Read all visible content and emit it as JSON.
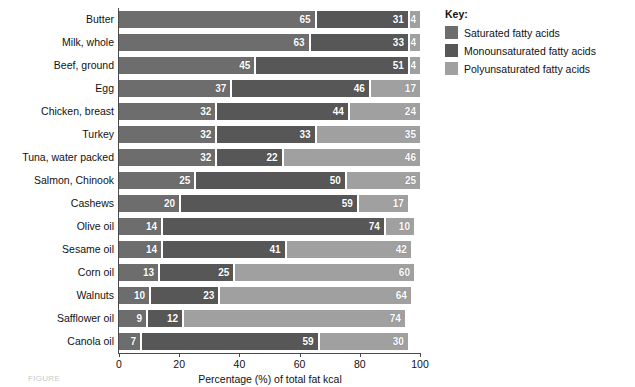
{
  "chart_data": {
    "type": "bar",
    "orientation": "horizontal",
    "stacked": true,
    "title": "",
    "xlabel": "Percentage (%) of total fat kcal",
    "ylabel": "",
    "xlim": [
      0,
      100
    ],
    "xticks": [
      "0",
      "20",
      "40",
      "60",
      "80",
      "100"
    ],
    "grid": false,
    "legend_position": "right",
    "categories": [
      "Butter",
      "Milk, whole",
      "Beef, ground",
      "Egg",
      "Chicken, breast",
      "Turkey",
      "Tuna, water packed",
      "Salmon, Chinook",
      "Cashews",
      "Olive oil",
      "Sesame oil",
      "Corn oil",
      "Walnuts",
      "Safflower oil",
      "Canola oil"
    ],
    "series": [
      {
        "name": "Saturated fatty acids",
        "color": "#6d6d6d",
        "values": [
          65,
          63,
          45,
          37,
          32,
          32,
          32,
          25,
          20,
          14,
          14,
          13,
          10,
          9,
          7
        ]
      },
      {
        "name": "Monounsaturated fatty acids",
        "color": "#575757",
        "values": [
          31,
          33,
          51,
          46,
          44,
          33,
          22,
          50,
          59,
          74,
          41,
          25,
          23,
          12,
          59
        ]
      },
      {
        "name": "Polyunsaturated fatty acids",
        "color": "#a0a0a0",
        "values": [
          4,
          4,
          4,
          17,
          24,
          35,
          46,
          25,
          17,
          10,
          42,
          60,
          64,
          74,
          30
        ]
      }
    ]
  },
  "legend": {
    "title": "Key:",
    "items": [
      {
        "label": "Saturated fatty acids",
        "color": "#6d6d6d"
      },
      {
        "label": "Monounsaturated fatty acids",
        "color": "#575757"
      },
      {
        "label": "Polyunsaturated fatty acids",
        "color": "#a0a0a0"
      }
    ]
  },
  "caption": "FIGURE"
}
